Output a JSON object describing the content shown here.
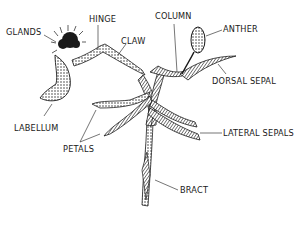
{
  "diagram": {
    "colors": {
      "ink": "#1a1a1a",
      "background": "#ffffff"
    },
    "labels": {
      "glands": "GLANDS",
      "hinge": "HINGE",
      "claw": "CLAW",
      "column": "COLUMN",
      "anther": "ANTHER",
      "dorsal_sepal": "DORSAL SEPAL",
      "labellum": "LABELLUM",
      "petals": "PETALS",
      "lateral_sepals": "LATERAL SEPALS",
      "bract": "BRACT"
    }
  }
}
